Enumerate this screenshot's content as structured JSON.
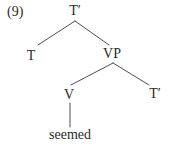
{
  "figure": {
    "number_label": "(9)",
    "type": "syntax-tree",
    "colors": {
      "text": "#2b2b2b",
      "line": "#4f4f4f",
      "background": "#ffffff"
    },
    "tree": {
      "nodes": [
        {
          "id": "root-tbar",
          "label": "T′",
          "x": 75,
          "y": 11
        },
        {
          "id": "t",
          "label": "T",
          "x": 31,
          "y": 56
        },
        {
          "id": "vp",
          "label": "VP",
          "x": 112,
          "y": 54
        },
        {
          "id": "v",
          "label": "V",
          "x": 69,
          "y": 95
        },
        {
          "id": "tbar-right",
          "label": "T′",
          "x": 155,
          "y": 94
        },
        {
          "id": "seemed",
          "label": "seemed",
          "x": 70,
          "y": 135
        }
      ],
      "edges": [
        {
          "from": "root-tbar",
          "to": "t",
          "x1": 75,
          "y1": 21,
          "x2": 38,
          "y2": 45
        },
        {
          "from": "root-tbar",
          "to": "vp",
          "x1": 75,
          "y1": 21,
          "x2": 109,
          "y2": 45
        },
        {
          "from": "vp",
          "to": "v",
          "x1": 113,
          "y1": 63,
          "x2": 71,
          "y2": 85
        },
        {
          "from": "vp",
          "to": "tbar-right",
          "x1": 113,
          "y1": 63,
          "x2": 149,
          "y2": 85
        },
        {
          "from": "v",
          "to": "seemed",
          "x1": 70,
          "y1": 103,
          "x2": 70,
          "y2": 127
        }
      ]
    }
  }
}
